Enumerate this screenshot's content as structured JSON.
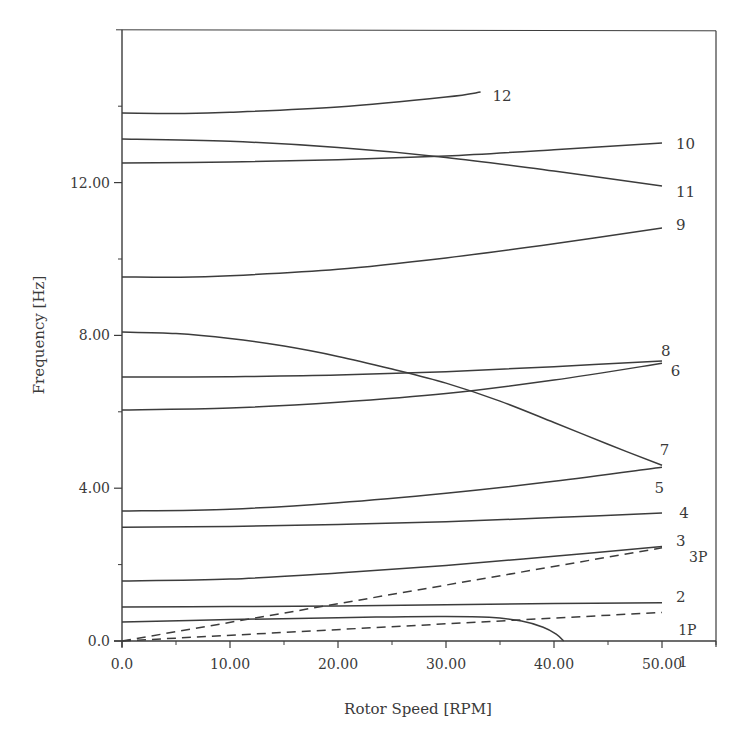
{
  "chart_data": {
    "type": "line",
    "title": "",
    "xlabel": "Rotor Speed [RPM]",
    "ylabel": "Frequency [Hz]",
    "xlim": [
      0,
      55
    ],
    "ylim": [
      0,
      16
    ],
    "grid": false,
    "legend_position": "inline labels at line ends",
    "x_ticks": [
      {
        "value": 0,
        "label": "0.0"
      },
      {
        "value": 10,
        "label": "10.00"
      },
      {
        "value": 20,
        "label": "20.00"
      },
      {
        "value": 30,
        "label": "30.00"
      },
      {
        "value": 40,
        "label": "40.00"
      },
      {
        "value": 50,
        "label": "50.00"
      }
    ],
    "x_minor_ticks": [
      5,
      15,
      25,
      35,
      45,
      55
    ],
    "y_ticks": [
      {
        "value": 0,
        "label": "0.0"
      },
      {
        "value": 4,
        "label": "4.00"
      },
      {
        "value": 8,
        "label": "8.00"
      },
      {
        "value": 12,
        "label": "12.00"
      }
    ],
    "y_minor_ticks": [
      2,
      6,
      10,
      14
    ],
    "series": [
      {
        "name": "1",
        "style": "solid",
        "label": "1",
        "x": [
          0,
          10,
          20,
          25,
          30,
          34,
          37,
          39,
          40.2,
          40.9
        ],
        "y": [
          0.5,
          0.56,
          0.61,
          0.63,
          0.64,
          0.62,
          0.52,
          0.36,
          0.18,
          0.0
        ],
        "label_at": [
          51.5,
          -0.55
        ]
      },
      {
        "name": "2",
        "style": "solid",
        "label": "2",
        "x": [
          0,
          10,
          20,
          30,
          40,
          50
        ],
        "y": [
          0.89,
          0.9,
          0.92,
          0.95,
          0.98,
          1.0
        ],
        "label_at": [
          51.3,
          1.15
        ]
      },
      {
        "name": "3",
        "style": "solid",
        "label": "3",
        "x": [
          0,
          10,
          20,
          30,
          40,
          50
        ],
        "y": [
          1.57,
          1.62,
          1.78,
          1.98,
          2.22,
          2.47
        ],
        "label_at": [
          51.3,
          2.62
        ]
      },
      {
        "name": "4",
        "style": "solid",
        "label": "4",
        "x": [
          0,
          10,
          20,
          30,
          40,
          50
        ],
        "y": [
          2.98,
          3.0,
          3.05,
          3.12,
          3.23,
          3.35
        ],
        "label_at": [
          51.6,
          3.35
        ]
      },
      {
        "name": "5",
        "style": "solid",
        "label": "5",
        "x": [
          0,
          10,
          20,
          30,
          40,
          50
        ],
        "y": [
          3.4,
          3.45,
          3.62,
          3.87,
          4.18,
          4.55
        ],
        "label_at": [
          49.3,
          4.0
        ]
      },
      {
        "name": "6",
        "style": "solid",
        "label": "6",
        "x": [
          0,
          10,
          20,
          30,
          40,
          50
        ],
        "y": [
          6.05,
          6.1,
          6.25,
          6.48,
          6.83,
          7.27
        ],
        "label_at": [
          50.8,
          7.08
        ]
      },
      {
        "name": "7",
        "style": "solid",
        "label": "7",
        "x": [
          0,
          5,
          10,
          15,
          20,
          25,
          30,
          35,
          40,
          45,
          50
        ],
        "y": [
          8.09,
          8.05,
          7.92,
          7.72,
          7.45,
          7.12,
          6.75,
          6.28,
          5.72,
          5.15,
          4.6
        ],
        "label_at": [
          49.8,
          5.0
        ]
      },
      {
        "name": "8",
        "style": "solid",
        "label": "8",
        "x": [
          0,
          10,
          20,
          30,
          40,
          50
        ],
        "y": [
          6.91,
          6.92,
          6.96,
          7.05,
          7.18,
          7.33
        ],
        "label_at": [
          49.9,
          7.6
        ]
      },
      {
        "name": "9",
        "style": "solid",
        "label": "9",
        "x": [
          0,
          5,
          10,
          20,
          30,
          40,
          50
        ],
        "y": [
          9.53,
          9.52,
          9.56,
          9.73,
          10.03,
          10.4,
          10.81
        ],
        "label_at": [
          51.3,
          10.9
        ]
      },
      {
        "name": "10",
        "style": "solid",
        "label": "10",
        "x": [
          0,
          10,
          20,
          30,
          40,
          50
        ],
        "y": [
          12.51,
          12.54,
          12.6,
          12.7,
          12.86,
          13.04
        ],
        "label_at": [
          51.3,
          13.0
        ]
      },
      {
        "name": "11",
        "style": "solid",
        "label": "11",
        "x": [
          0,
          10,
          20,
          30,
          40,
          50
        ],
        "y": [
          13.14,
          13.08,
          12.92,
          12.66,
          12.3,
          11.91
        ],
        "label_at": [
          51.3,
          11.75
        ]
      },
      {
        "name": "12",
        "style": "solid",
        "label": "12",
        "x": [
          0,
          5,
          10,
          20,
          30,
          33.2
        ],
        "y": [
          13.82,
          13.81,
          13.84,
          13.98,
          14.24,
          14.37
        ],
        "label_at": [
          34.3,
          14.28
        ]
      },
      {
        "name": "1P",
        "style": "dashed",
        "label": "1P",
        "x": [
          0,
          50
        ],
        "y": [
          0.0,
          0.75
        ],
        "label_at": [
          51.5,
          0.3
        ]
      },
      {
        "name": "3P",
        "style": "dashed",
        "label": "3P",
        "x": [
          0,
          50
        ],
        "y": [
          0.0,
          2.44
        ],
        "label_at": [
          52.5,
          2.2
        ]
      }
    ]
  },
  "colors": {
    "line": "#3c3c3c",
    "axis": "#3c3c3c",
    "text": "#3a3a3a",
    "background": "#ffffff"
  }
}
